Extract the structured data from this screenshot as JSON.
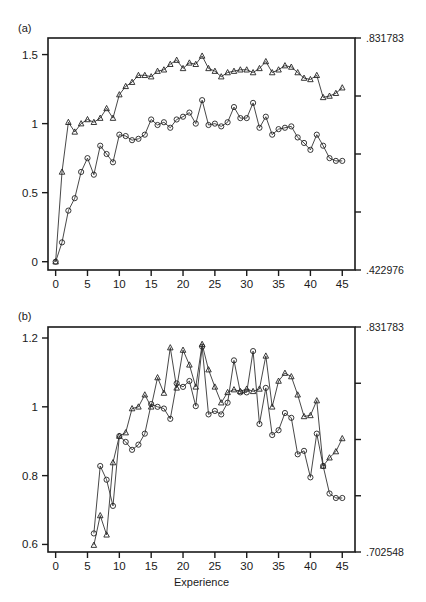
{
  "figure": {
    "width": 426,
    "height": 602,
    "background": "#ffffff",
    "ink": "#1a1a1a"
  },
  "panels": {
    "a": {
      "tag": "(a)"
    },
    "b": {
      "tag": "(b)"
    }
  },
  "chart_data": [
    {
      "id": "panel-a",
      "type": "line",
      "title": "(a)",
      "xlabel": "",
      "ylabel": "",
      "xlim": [
        -1.2,
        47
      ],
      "ylim": [
        -0.06,
        1.62
      ],
      "grid": false,
      "legend": "none",
      "xticks": [
        0,
        5,
        10,
        15,
        20,
        25,
        30,
        35,
        40,
        45
      ],
      "xticklabels": [
        "0",
        "5",
        "10",
        "15",
        "20",
        "25",
        "30",
        "35",
        "40",
        "45"
      ],
      "yticks": [
        0,
        0.5,
        1,
        1.5
      ],
      "yticklabels": [
        "0",
        "0.5",
        "1",
        "1.5"
      ],
      "right_axis": {
        "labels_shown": [
          ".831783",
          ".422976"
        ],
        "top_label": ".831783",
        "bottom_label": ".422976",
        "n_ticks": 5,
        "tick_fractions": [
          1.0,
          0.75,
          0.5,
          0.25,
          0.0
        ]
      },
      "x": [
        0,
        1,
        2,
        3,
        4,
        5,
        6,
        7,
        8,
        9,
        10,
        11,
        12,
        13,
        14,
        15,
        16,
        17,
        18,
        19,
        20,
        21,
        22,
        23,
        24,
        25,
        26,
        27,
        28,
        29,
        30,
        31,
        32,
        33,
        34,
        35,
        36,
        37,
        38,
        39,
        40,
        41,
        42,
        43,
        44,
        45
      ],
      "series": [
        {
          "name": "triangle-series",
          "marker": "triangle",
          "values": [
            0.0,
            0.65,
            1.01,
            0.94,
            1.0,
            1.03,
            1.01,
            1.04,
            1.11,
            1.04,
            1.21,
            1.27,
            1.3,
            1.35,
            1.35,
            1.34,
            1.38,
            1.39,
            1.43,
            1.46,
            1.4,
            1.44,
            1.43,
            1.49,
            1.4,
            1.38,
            1.34,
            1.37,
            1.38,
            1.39,
            1.39,
            1.37,
            1.4,
            1.45,
            1.37,
            1.39,
            1.42,
            1.41,
            1.37,
            1.33,
            1.32,
            1.35,
            1.19,
            1.2,
            1.22,
            1.26
          ]
        },
        {
          "name": "circle-series",
          "marker": "circle",
          "values": [
            0.0,
            0.14,
            0.37,
            0.46,
            0.65,
            0.75,
            0.63,
            0.84,
            0.78,
            0.72,
            0.92,
            0.91,
            0.88,
            0.89,
            0.92,
            1.03,
            0.99,
            1.01,
            0.97,
            1.03,
            1.05,
            1.08,
            1.0,
            1.17,
            0.99,
            1.0,
            0.98,
            1.01,
            1.12,
            1.04,
            1.04,
            1.15,
            0.97,
            1.05,
            0.92,
            0.96,
            0.97,
            0.98,
            0.9,
            0.86,
            0.81,
            0.92,
            0.84,
            0.75,
            0.73,
            0.73
          ]
        }
      ]
    },
    {
      "id": "panel-b",
      "type": "line",
      "title": "(b)",
      "xlabel": "Experience",
      "ylabel": "",
      "xlim": [
        -1.2,
        47
      ],
      "ylim": [
        0.578,
        1.232
      ],
      "grid": false,
      "legend": "none",
      "xticks": [
        0,
        5,
        10,
        15,
        20,
        25,
        30,
        35,
        40,
        45
      ],
      "xticklabels": [
        "0",
        "5",
        "10",
        "15",
        "20",
        "25",
        "30",
        "35",
        "40",
        "45"
      ],
      "yticks": [
        0.6,
        0.8,
        1.0,
        1.2
      ],
      "yticklabels": [
        "0.6",
        "0.8",
        "1",
        "1.2"
      ],
      "right_axis": {
        "labels_shown": [
          ".831783",
          ".702548"
        ],
        "top_label": ".831783",
        "bottom_label": ".702548",
        "n_ticks": 5,
        "tick_fractions": [
          1.0,
          0.75,
          0.5,
          0.25,
          0.0
        ]
      },
      "x": [
        6,
        7,
        8,
        9,
        10,
        11,
        12,
        13,
        14,
        15,
        16,
        17,
        18,
        19,
        20,
        21,
        22,
        23,
        24,
        25,
        26,
        27,
        28,
        29,
        30,
        31,
        32,
        33,
        34,
        35,
        36,
        37,
        38,
        39,
        40,
        41,
        42,
        43,
        44,
        45
      ],
      "series": [
        {
          "name": "triangle-series",
          "marker": "triangle",
          "values": [
            0.598,
            0.684,
            0.628,
            0.838,
            0.915,
            0.925,
            0.995,
            1.0,
            1.035,
            1.0,
            1.085,
            1.04,
            1.172,
            1.055,
            1.165,
            1.122,
            1.058,
            1.182,
            1.108,
            1.058,
            1.012,
            1.042,
            1.05,
            1.045,
            1.052,
            1.045,
            1.052,
            1.148,
            1.0,
            1.075,
            1.098,
            1.088,
            1.035,
            0.972,
            0.975,
            1.018,
            0.828,
            0.852,
            0.87,
            0.908
          ]
        },
        {
          "name": "circle-series",
          "marker": "circle",
          "values": [
            0.632,
            0.828,
            0.788,
            0.712,
            0.915,
            0.898,
            0.875,
            0.89,
            0.922,
            1.008,
            1.0,
            0.995,
            0.965,
            1.068,
            1.058,
            1.075,
            1.002,
            1.175,
            0.978,
            0.988,
            0.978,
            1.012,
            1.135,
            1.042,
            1.042,
            1.162,
            0.95,
            1.055,
            0.918,
            0.932,
            0.982,
            0.968,
            0.862,
            0.872,
            0.795,
            0.922,
            0.828,
            0.748,
            0.735,
            0.735
          ]
        }
      ]
    }
  ]
}
